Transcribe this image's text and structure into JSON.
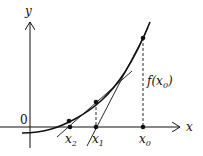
{
  "diagram": {
    "title": "",
    "axes": {
      "x_label": "x",
      "y_label": "y",
      "origin_label": "0"
    },
    "points": [
      {
        "name": "x0",
        "label": "x",
        "sub": "0"
      },
      {
        "name": "x1",
        "label": "x",
        "sub": "1"
      },
      {
        "name": "x2",
        "label": "x",
        "sub": "2"
      }
    ],
    "annotation": {
      "func": "f(x",
      "sub": "0",
      "close": ")"
    }
  }
}
